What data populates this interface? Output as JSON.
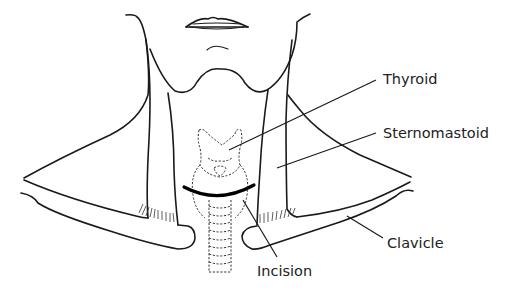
{
  "diagram": {
    "labels": {
      "thyroid": "Thyroid",
      "sternomastoid": "Sternomastoid",
      "clavicle": "Clavicle",
      "incision": "Incision"
    },
    "colors": {
      "line": "#1a1a1a",
      "background": "#ffffff",
      "incision": "#000000"
    }
  }
}
